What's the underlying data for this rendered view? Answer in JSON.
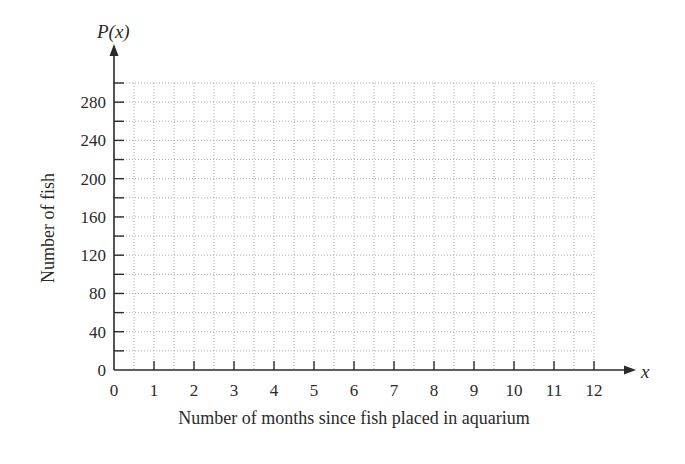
{
  "chart_data": {
    "type": "line",
    "title": "",
    "xlabel": "Number of months since fish placed in aquarium",
    "ylabel": "Number of fish",
    "x_axis_variable": "x",
    "y_axis_variable": "P(x)",
    "xlim": [
      0,
      12
    ],
    "ylim": [
      0,
      300
    ],
    "x_ticks": [
      0,
      1,
      2,
      3,
      4,
      5,
      6,
      7,
      8,
      9,
      10,
      11,
      12
    ],
    "x_tick_labels": [
      "0",
      "1",
      "2",
      "3",
      "4",
      "5",
      "6",
      "7",
      "8",
      "9",
      "10",
      "11",
      "12"
    ],
    "y_ticks": [
      0,
      20,
      40,
      60,
      80,
      100,
      120,
      140,
      160,
      180,
      200,
      220,
      240,
      260,
      280,
      300
    ],
    "y_tick_labels": [
      "0",
      "40",
      "80",
      "120",
      "160",
      "200",
      "240",
      "280"
    ],
    "y_labeled_values": [
      0,
      40,
      80,
      120,
      160,
      200,
      240,
      280
    ],
    "grid": true,
    "grid_style": "dotted",
    "x_grid_step": 0.5,
    "y_grid_step": 20,
    "series": [],
    "legend": null
  },
  "colors": {
    "axis": "#2a2a2a",
    "grid": "#9a9a9a",
    "text": "#2a2a2a",
    "background": "#ffffff"
  }
}
